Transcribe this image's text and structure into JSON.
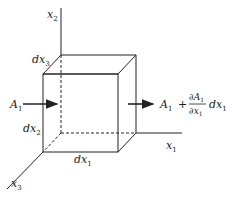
{
  "diagram": {
    "type": "control-volume-cube",
    "axes": {
      "x1": {
        "label": "x",
        "sub": "1"
      },
      "x2": {
        "label": "x",
        "sub": "2"
      },
      "x3": {
        "label": "x",
        "sub": "3"
      }
    },
    "edges": {
      "dx1": {
        "label": "dx",
        "sub": "1"
      },
      "dx2": {
        "label": "dx",
        "sub": "2"
      },
      "dx3": {
        "label": "dx",
        "sub": "3"
      }
    },
    "inflow": {
      "label": "A",
      "sub": "1"
    },
    "outflow": {
      "term1": "A",
      "term1_sub": "1",
      "plus": "+",
      "numerator": "∂A",
      "numerator_sub": "1",
      "denominator": "∂x",
      "denominator_sub": "1",
      "factor": "dx",
      "factor_sub": "1"
    },
    "colors": {
      "line": "#222222",
      "background": "#ffffff"
    }
  }
}
